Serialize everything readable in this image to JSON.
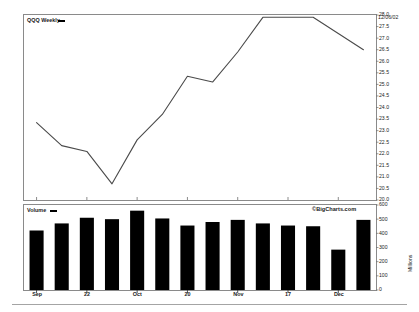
{
  "header": {
    "series_label": "QQQ Weekly",
    "date_label": "12/06/02"
  },
  "volume_panel": {
    "series_label": "Volume",
    "watermark": "©BigCharts.com",
    "axis_title": "Millions"
  },
  "chart_data": [
    {
      "type": "line",
      "title": "QQQ Weekly",
      "xlabel": "",
      "ylabel": "",
      "ylim": [
        20.0,
        28.0
      ],
      "grid": false,
      "legend": "QQQ Weekly",
      "annotations": [
        "12/06/02"
      ],
      "ytick_labels": [
        "28.0",
        "27.5",
        "27.0",
        "26.5",
        "26.0",
        "25.5",
        "25.0",
        "24.5",
        "24.0",
        "23.5",
        "23.0",
        "22.5",
        "22.0",
        "21.5",
        "21.0",
        "20.5",
        "20.0"
      ],
      "ytick_values": [
        28.0,
        27.5,
        27.0,
        26.5,
        26.0,
        25.5,
        25.0,
        24.5,
        24.0,
        23.5,
        23.0,
        22.5,
        22.0,
        21.5,
        21.0,
        20.5,
        20.0
      ],
      "xtick_labels": [
        "Sep",
        "22",
        "Oct",
        "20",
        "Nov",
        "17",
        "Dec"
      ],
      "x": [
        0,
        1,
        2,
        3,
        4,
        5,
        6,
        7,
        8,
        9,
        10,
        11,
        12,
        13
      ],
      "values": [
        23.35,
        22.35,
        22.1,
        20.7,
        22.6,
        23.7,
        25.35,
        25.1,
        26.4,
        27.9,
        27.9,
        27.9,
        27.2,
        26.5
      ]
    },
    {
      "type": "bar",
      "title": "Volume",
      "xlabel": "",
      "ylabel": "Millions",
      "ylim": [
        0,
        600
      ],
      "grid": false,
      "legend": "Volume",
      "ytick_labels": [
        "600",
        "500",
        "400",
        "300",
        "200",
        "100",
        "0"
      ],
      "ytick_values": [
        600,
        500,
        400,
        300,
        200,
        100,
        0
      ],
      "xtick_labels": [
        "Sep",
        "22",
        "Oct",
        "20",
        "Nov",
        "17",
        "Dec"
      ],
      "categories": [
        "1",
        "2",
        "3",
        "4",
        "5",
        "6",
        "7",
        "8",
        "9",
        "10",
        "11",
        "12",
        "13",
        "14"
      ],
      "values": [
        420,
        470,
        510,
        500,
        560,
        505,
        455,
        480,
        495,
        470,
        455,
        450,
        285,
        495
      ]
    }
  ]
}
